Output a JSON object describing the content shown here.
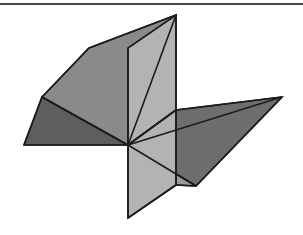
{
  "page": {
    "background_color": "#ffffff",
    "width": 303,
    "height": 235
  },
  "top_rule": {
    "name": "horizontal-rule",
    "color": "#4a4a4a",
    "y": 3,
    "thickness": 2
  },
  "figure": {
    "center_point": [
      128,
      145
    ],
    "edge_color": "#1c1c1c",
    "edge_width": 1.6,
    "palette": {
      "light_gray": "#b3b3b3",
      "mid_gray": "#9a9a9a",
      "medium_gray": "#8a8a8a",
      "dark_gray": "#6e6e6e",
      "darker_gray": "#5e5e5e"
    },
    "faces": [
      {
        "id": "vertical-plane-upper",
        "label": "Vertical plane, upper half",
        "fill": "#b3b3b3",
        "points": "176,15 176,110 128,145 128,48"
      },
      {
        "id": "vertical-plane-lower",
        "label": "Vertical plane, lower half",
        "fill": "#b3b3b3",
        "points": "128,145 176,110 176,185 128,218"
      },
      {
        "id": "upper-left-plane",
        "label": "Upper-left slanted plane",
        "fill": "#8a8a8a",
        "points": "89,48 176,15 128,145 42,97"
      },
      {
        "id": "lower-left-plane",
        "label": "Lower-left horizontal plane",
        "fill": "#5e5e5e",
        "points": "42,97 128,145 24,145"
      },
      {
        "id": "right-plane-upper",
        "label": "Right horizontal plane, upper wedge",
        "fill": "#6e6e6e",
        "points": "176,110 282,97 196,186 128,145"
      },
      {
        "id": "right-plane-lower",
        "label": "Right horizontal plane, lower wedge",
        "fill": "#9a9a9a",
        "points": "128,145 196,186 176,185"
      }
    ]
  }
}
